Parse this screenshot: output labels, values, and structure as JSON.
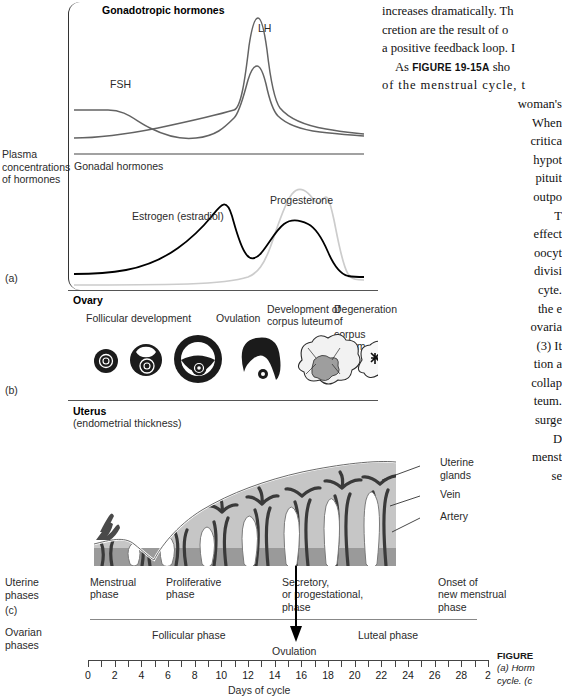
{
  "figure": {
    "panel_a_tag": "(a)",
    "panel_b_tag": "(b)",
    "panel_c_tag": "(c)",
    "axis_title": "Days of cycle",
    "axis_ticks": [
      0,
      2,
      4,
      6,
      8,
      10,
      12,
      14,
      16,
      18,
      20,
      22,
      24,
      26,
      28,
      2
    ],
    "y_axis_label_line1": "Plasma",
    "y_axis_label_line2": "concentrations",
    "y_axis_label_line3": "of hormones",
    "uterine_phases_l1": "Uterine",
    "uterine_phases_l2": "phases",
    "ovarian_phases_l1": "Ovarian",
    "ovarian_phases_l2": "phases"
  },
  "panel_a": {
    "title": "Gonadotropic hormones",
    "subtitle": "Gonadal hormones",
    "curve_lh": "LH",
    "curve_fsh": "FSH",
    "curve_estrogen": "Estrogen (estradiol)",
    "curve_progesterone": "Progesterone"
  },
  "panel_b": {
    "title": "Ovary",
    "stages": [
      "Follicular development",
      "Ovulation",
      "Development of\ncorpus luteum",
      "Degeneration of\ncorpus luteum"
    ],
    "stage_1": "Follicular development",
    "stage_2": "Ovulation",
    "stage_3_l1": "Development of",
    "stage_3_l2": "corpus luteum",
    "stage_4_l1": "Degeneration of",
    "stage_4_l2": "corpus luteum"
  },
  "panel_c": {
    "title": "Uterus",
    "subtitle": "(endometrial thickness)",
    "callout_glands_l1": "Uterine",
    "callout_glands_l2": "glands",
    "callout_vein": "Vein",
    "callout_artery": "Artery",
    "uterine_phase_1_l1": "Menstrual",
    "uterine_phase_1_l2": "phase",
    "uterine_phase_2_l1": "Proliferative",
    "uterine_phase_2_l2": "phase",
    "uterine_phase_3_l1": "Secretory,",
    "uterine_phase_3_l2": "or progestational,",
    "uterine_phase_3_l3": "phase",
    "uterine_phase_4_l1": "Onset of",
    "uterine_phase_4_l2": "new menstrual",
    "uterine_phase_4_l3": "phase",
    "ovarian_phase_1": "Follicular phase",
    "ovarian_phase_2": "Luteal phase",
    "ovulation_label": "Ovulation"
  },
  "body_text": {
    "lines": [
      "increases dramatically. Th",
      "cretion are the result of o",
      "a positive feedback loop. I",
      "As FIGURE 19-15A sho",
      "of the menstrual cycle, t",
      "woman's",
      "When",
      "critica",
      "hypot",
      "pituit",
      "outpo",
      "T",
      "effect",
      "oocyt",
      "divisi",
      "cyte.",
      "the e",
      "ovaria",
      "(3) It",
      "tion a",
      "collap",
      "teum.",
      "surge",
      "D",
      "menst",
      "se"
    ],
    "l0": "increases dramatically. Th",
    "l1": "cretion are the result of o",
    "l2": "a positive feedback loop. I",
    "l3_a": "As ",
    "l3_b": "FIGURE 19-15A",
    "l3_c": " sho",
    "l4": "of the menstrual cycle, t",
    "l5": "woman's",
    "l6": "When",
    "l7": "critica",
    "l8": "hypot",
    "l9": "pituit",
    "l10": "outpo",
    "l11": "T",
    "l12": "effect",
    "l13": "oocyt",
    "l14": "divisi",
    "l15": "cyte.",
    "l16": "the e",
    "l17": "ovaria",
    "l18": "(3) It",
    "l19": "tion a",
    "l20": "collap",
    "l21": "teum.",
    "l22": "surge",
    "l23": "D",
    "l24": "menst",
    "l25": "se"
  },
  "figure_caption": {
    "head": "FIGURE",
    "l1": "(a) Horm",
    "l2": "cycle. (c"
  },
  "chart_data": {
    "type": "line",
    "xlabel": "Days of cycle",
    "ylabel": "Plasma concentrations of hormones",
    "xlim": [
      0,
      30
    ],
    "grid": false,
    "legend": "inline-labels",
    "series": [
      {
        "name": "LH",
        "color": "#555555",
        "x": [
          0,
          2,
          4,
          6,
          8,
          10,
          11,
          12,
          13,
          13.5,
          14,
          14.5,
          15,
          16,
          18,
          20,
          22,
          24,
          26,
          28,
          30
        ],
        "y": [
          0.22,
          0.22,
          0.22,
          0.21,
          0.22,
          0.24,
          0.27,
          0.32,
          0.55,
          0.88,
          1.0,
          0.8,
          0.5,
          0.34,
          0.3,
          0.27,
          0.25,
          0.23,
          0.22,
          0.22,
          0.22
        ]
      },
      {
        "name": "FSH",
        "color": "#555555",
        "x": [
          0,
          2,
          4,
          6,
          8,
          10,
          11,
          12,
          13,
          13.5,
          14,
          14.5,
          15,
          16,
          18,
          20,
          22,
          24,
          26,
          28,
          30
        ],
        "y": [
          0.4,
          0.4,
          0.39,
          0.35,
          0.28,
          0.25,
          0.26,
          0.29,
          0.4,
          0.54,
          0.6,
          0.5,
          0.36,
          0.3,
          0.27,
          0.24,
          0.22,
          0.2,
          0.19,
          0.19,
          0.19
        ]
      },
      {
        "name": "Estrogen (estradiol)",
        "color": "#000000",
        "x": [
          0,
          2,
          4,
          6,
          8,
          10,
          11,
          12,
          13,
          14,
          15,
          16,
          17,
          18,
          20,
          22,
          24,
          26,
          27,
          28,
          30
        ],
        "y": [
          0.08,
          0.08,
          0.09,
          0.12,
          0.18,
          0.3,
          0.42,
          0.62,
          0.78,
          0.72,
          0.45,
          0.3,
          0.32,
          0.42,
          0.58,
          0.6,
          0.52,
          0.3,
          0.18,
          0.14,
          0.14
        ]
      },
      {
        "name": "Progesterone",
        "color": "#c9c9c9",
        "x": [
          0,
          2,
          4,
          6,
          8,
          10,
          12,
          13,
          14,
          15,
          16,
          18,
          20,
          22,
          24,
          25,
          26,
          27,
          28,
          30
        ],
        "y": [
          0.03,
          0.03,
          0.03,
          0.03,
          0.03,
          0.03,
          0.04,
          0.05,
          0.08,
          0.2,
          0.4,
          0.75,
          0.92,
          0.92,
          0.8,
          0.55,
          0.28,
          0.12,
          0.07,
          0.08
        ]
      }
    ],
    "annotations": [
      {
        "text": "LH peak (ovulatory surge)",
        "x": 14
      },
      {
        "text": "Ovulation",
        "x": 14
      }
    ]
  }
}
